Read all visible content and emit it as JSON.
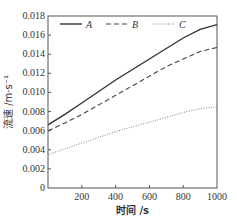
{
  "chart_data": {
    "type": "line",
    "title": "",
    "xlabel": "时间 /s",
    "ylabel": "流速 /m·s⁻¹",
    "xlim": [
      0,
      1000
    ],
    "ylim": [
      0,
      0.018
    ],
    "xticks": [
      "200",
      "400",
      "600",
      "800",
      "1000"
    ],
    "yticks": [
      "0",
      "0.002",
      "0.004",
      "0.006",
      "0.008",
      "0.010",
      "0.012",
      "0.014",
      "0.016",
      "0.018"
    ],
    "grid": false,
    "legend_position": "top inside",
    "x": [
      0,
      100,
      200,
      300,
      400,
      500,
      600,
      700,
      800,
      900,
      1000
    ],
    "series": [
      {
        "name": "A",
        "style": "solid",
        "values": [
          0.0066,
          0.0077,
          0.0089,
          0.0101,
          0.0113,
          0.0124,
          0.0135,
          0.0146,
          0.0157,
          0.0166,
          0.0171
        ]
      },
      {
        "name": "B",
        "style": "dashed",
        "values": [
          0.006,
          0.0068,
          0.0077,
          0.0087,
          0.0097,
          0.0107,
          0.0117,
          0.0127,
          0.0135,
          0.0143,
          0.0147
        ]
      },
      {
        "name": "C",
        "style": "dotted",
        "values": [
          0.0035,
          0.0041,
          0.0047,
          0.0053,
          0.0059,
          0.0064,
          0.0069,
          0.0074,
          0.0079,
          0.0083,
          0.0085
        ]
      }
    ]
  }
}
